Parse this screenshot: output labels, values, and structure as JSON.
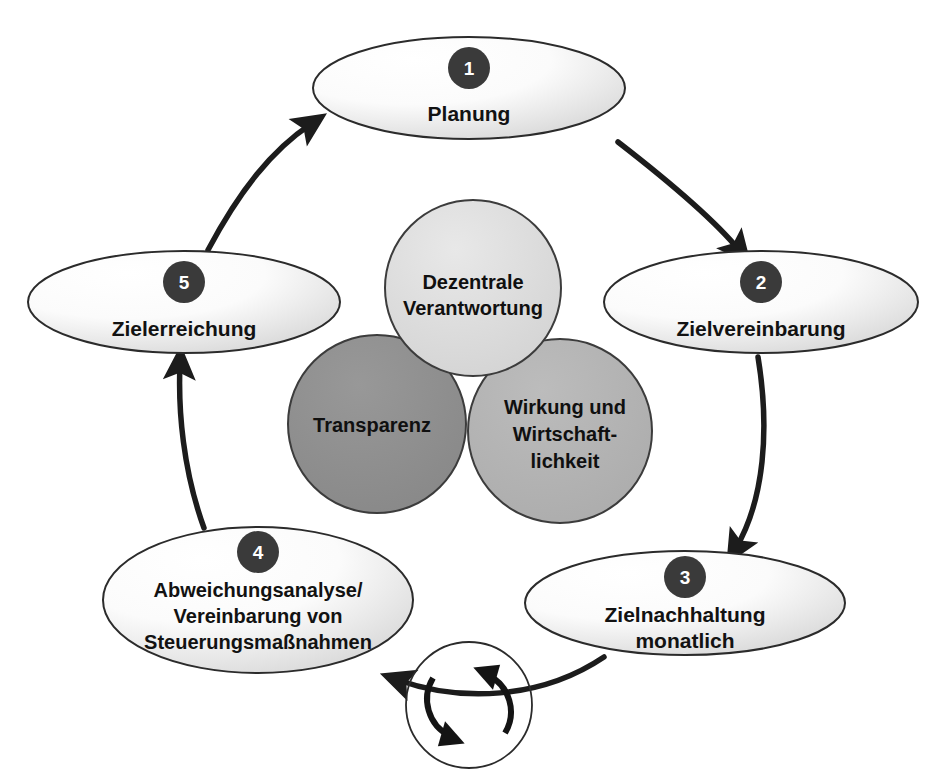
{
  "diagram": {
    "type": "cycle-diagram",
    "colors": {
      "badge_fill": "#3a3a3a",
      "badge_text": "#ffffff",
      "ellipse_fill_light": "#ffffff",
      "ellipse_fill_shade": "#d8d8d8",
      "ellipse_stroke": "#2b2b2b",
      "core_top_fill": "#dcdcdc",
      "core_left_fill": "#8e8e8e",
      "core_right_fill": "#b4b4b4",
      "core_stroke": "#3c3c3c",
      "arrow_stroke": "#1c1c1c",
      "text": "#121212"
    },
    "cycle_nodes": [
      {
        "number": "1",
        "label_lines": [
          "Planung"
        ],
        "position": "top"
      },
      {
        "number": "2",
        "label_lines": [
          "Zielvereinbarung"
        ],
        "position": "right"
      },
      {
        "number": "3",
        "label_lines": [
          "Zielnachhaltung",
          "monatlich"
        ],
        "position": "bottom-right"
      },
      {
        "number": "4",
        "label_lines": [
          "Abweichungsanalyse/",
          "Vereinbarung von",
          "Steuerungsmaßnahmen"
        ],
        "position": "bottom-left"
      },
      {
        "number": "5",
        "label_lines": [
          "Zielerreichung"
        ],
        "position": "left"
      }
    ],
    "core_circles": [
      {
        "id": "core-top",
        "label_lines": [
          "Dezentrale",
          "Verantwortung"
        ],
        "fill": "#dcdcdc"
      },
      {
        "id": "core-left",
        "label_lines": [
          "Transparenz"
        ],
        "fill": "#8e8e8e"
      },
      {
        "id": "core-right",
        "label_lines": [
          "Wirkung und",
          "Wirtschaft-",
          "lichkeit"
        ],
        "fill": "#b4b4b4"
      }
    ],
    "cycle_icon": {
      "name": "circular-arrows-icon",
      "description": "two curved arrows forming a clockwise loop"
    },
    "flow_order": [
      "1",
      "2",
      "3",
      "4",
      "5",
      "1"
    ]
  }
}
